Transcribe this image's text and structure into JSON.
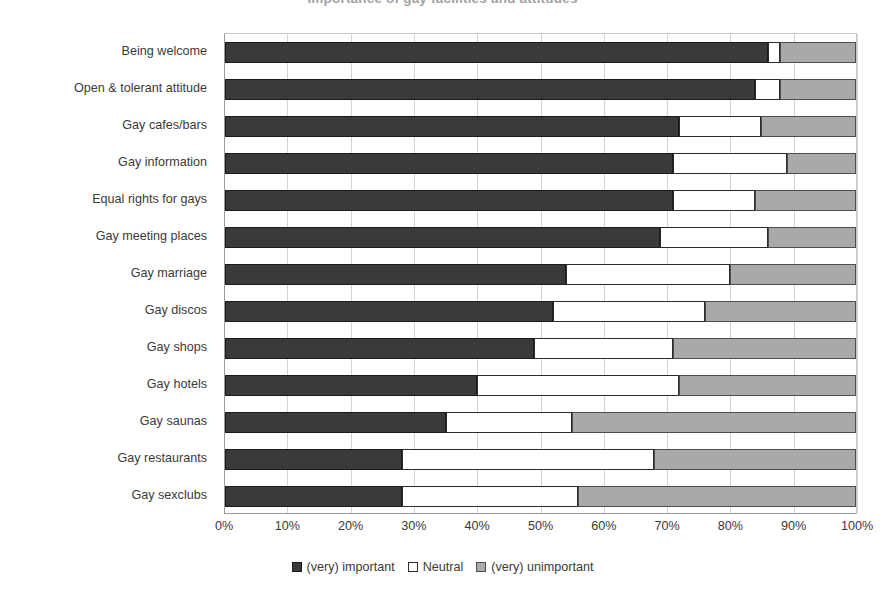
{
  "chart_data": {
    "type": "bar",
    "orientation": "horizontal",
    "stacked": true,
    "normalized": true,
    "title": "Importance of gay facilities and attitudes",
    "xlabel": "",
    "ylabel": "",
    "xlim": [
      0,
      100
    ],
    "xticks": [
      "0%",
      "10%",
      "20%",
      "30%",
      "40%",
      "50%",
      "60%",
      "70%",
      "80%",
      "90%",
      "100%"
    ],
    "grid": true,
    "legend_position": "bottom",
    "categories": [
      "Being welcome",
      "Open & tolerant attitude",
      "Gay cafes/bars",
      "Gay information",
      "Equal rights for gays",
      "Gay meeting places",
      "Gay marriage",
      "Gay discos",
      "Gay shops",
      "Gay hotels",
      "Gay saunas",
      "Gay restaurants",
      "Gay sexclubs"
    ],
    "series": [
      {
        "name": "(very) important",
        "color": "#3a3a3a",
        "values": [
          86,
          84,
          72,
          71,
          71,
          69,
          54,
          52,
          49,
          40,
          35,
          28,
          28
        ]
      },
      {
        "name": "Neutral",
        "color": "#ffffff",
        "values": [
          2,
          4,
          13,
          18,
          13,
          17,
          26,
          24,
          22,
          32,
          20,
          40,
          28
        ]
      },
      {
        "name": "(very) unimportant",
        "color": "#a9a9a9",
        "values": [
          12,
          12,
          15,
          11,
          16,
          14,
          20,
          24,
          29,
          28,
          45,
          32,
          44
        ]
      }
    ]
  },
  "legend": {
    "items": [
      {
        "label": "(very) important",
        "swatch": "filled-dark-square-icon"
      },
      {
        "label": "Neutral",
        "swatch": "hollow-white-square-icon"
      },
      {
        "label": "(very) unimportant",
        "swatch": "filled-gray-square-icon"
      }
    ]
  }
}
